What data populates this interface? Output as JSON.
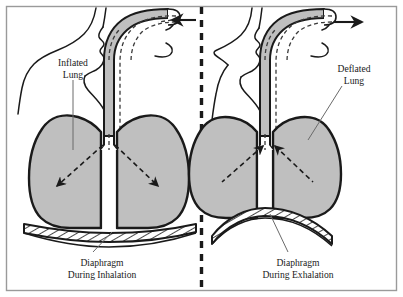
{
  "figure": {
    "panels": [
      {
        "id": "inhalation",
        "side": "left",
        "lung_label_line1": "Inflated",
        "lung_label_line2": "Lung",
        "diaphragm_label_line1": "Diaphragm",
        "diaphragm_label_line2": "During Inhalation",
        "airflow_direction": "in",
        "airflow_arrow": "arrow-left",
        "lung_arrow_direction": "outward-down",
        "diaphragm_state": "flattened-contracted"
      },
      {
        "id": "exhalation",
        "side": "right",
        "lung_label_line1": "Deflated",
        "lung_label_line2": "Lung",
        "diaphragm_label_line1": "Diaphragm",
        "diaphragm_label_line2": "During Exhalation",
        "airflow_direction": "out",
        "airflow_arrow": "arrow-right",
        "lung_arrow_direction": "inward-up",
        "diaphragm_state": "domed-relaxed"
      }
    ],
    "colors": {
      "lung_fill": "#bfbfbf",
      "airway_fill": "#bfbfbf",
      "outline": "#1a1a1a",
      "background": "#ffffff",
      "border": "#9a9a9a",
      "diaphragm_hatch": "#1a1a1a"
    }
  }
}
